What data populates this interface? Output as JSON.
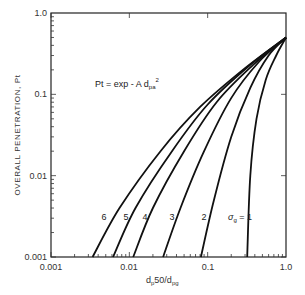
{
  "chart_data": {
    "type": "line",
    "title": "",
    "xlabel": "d_p50/d_pg",
    "ylabel": "OVERALL PENETRATION, Pt",
    "xscale": "log",
    "yscale": "log",
    "xlim": [
      0.001,
      1.0
    ],
    "ylim": [
      0.001,
      1.0
    ],
    "grid": false,
    "x_tick_labels": [
      "0.001",
      "0.01",
      "0.1",
      "1.0"
    ],
    "y_tick_labels": [
      "0.001",
      "0.01",
      "0.1",
      "1.0"
    ],
    "annotation": "Pt = exp - A d_pa^2",
    "legend_position": "inline curve labels",
    "series": [
      {
        "name": "σg = 1",
        "label": "1",
        "x": [
          0.32,
          0.35,
          0.42,
          0.55,
          0.75,
          1.0
        ],
        "y": [
          0.001,
          0.01,
          0.05,
          0.15,
          0.3,
          0.5
        ]
      },
      {
        "name": "σg = 2",
        "label": "2",
        "x": [
          0.082,
          0.12,
          0.2,
          0.35,
          0.6,
          1.0
        ],
        "y": [
          0.001,
          0.005,
          0.03,
          0.12,
          0.3,
          0.5
        ]
      },
      {
        "name": "σg = 3",
        "label": "3",
        "x": [
          0.027,
          0.045,
          0.09,
          0.2,
          0.45,
          1.0
        ],
        "y": [
          0.001,
          0.004,
          0.02,
          0.09,
          0.25,
          0.5
        ]
      },
      {
        "name": "σg = 4",
        "label": "4",
        "x": [
          0.0112,
          0.02,
          0.05,
          0.13,
          0.38,
          1.0
        ],
        "y": [
          0.001,
          0.004,
          0.02,
          0.08,
          0.23,
          0.5
        ]
      },
      {
        "name": "σg = 5",
        "label": "5",
        "x": [
          0.0062,
          0.012,
          0.035,
          0.1,
          0.33,
          1.0
        ],
        "y": [
          0.001,
          0.004,
          0.02,
          0.075,
          0.22,
          0.5
        ]
      },
      {
        "name": "σg = 6",
        "label": "6",
        "x": [
          0.0034,
          0.0075,
          0.025,
          0.08,
          0.3,
          1.0
        ],
        "y": [
          0.001,
          0.004,
          0.02,
          0.07,
          0.21,
          0.5
        ]
      }
    ]
  },
  "labels": {
    "y1": "1.0",
    "y01": "0.1",
    "y001": "0.01",
    "y0001": "0.001",
    "x0001": "0.001",
    "x001": "0.01",
    "x01": "0.1",
    "x1": "1.0",
    "ylabel": "OVERALL PENETRATION, Pt",
    "xlabel_main": "d",
    "xlabel_sub1": "p",
    "xlabel_mid": "50/d",
    "xlabel_sub2": "pg",
    "formula_main": "Pt = exp - A d",
    "formula_sub": "pa",
    "formula_sup": "2",
    "c6": "6",
    "c5": "5",
    "c4": "4",
    "c3": "3",
    "c2": "2",
    "sigma": "σ",
    "sigma_sub": "g",
    "c1": " = 1"
  }
}
